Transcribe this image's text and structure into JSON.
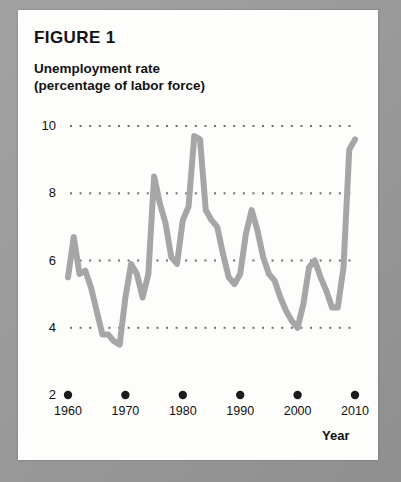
{
  "figure": {
    "title": "FIGURE 1",
    "subtitle_line1": "Unemployment rate",
    "subtitle_line2": "(percentage of labor force)"
  },
  "axis": {
    "x_name": "Year"
  },
  "chart_data": {
    "type": "line",
    "title": "Unemployment rate (percentage of labor force)",
    "xlabel": "Year",
    "ylabel": "",
    "xlim": [
      1960,
      2010
    ],
    "ylim": [
      2,
      10
    ],
    "ytick_labels": [
      "10",
      "8",
      "6",
      "4",
      "2"
    ],
    "yticks": [
      10,
      8,
      6,
      4,
      2
    ],
    "xtick_labels": [
      "1960",
      "1970",
      "1980",
      "1990",
      "2000",
      "2010"
    ],
    "xticks": [
      1960,
      1970,
      1980,
      1990,
      2000,
      2010
    ],
    "grid": "horizontal-dotted",
    "legend": "none",
    "line_color": "#a6a6a6",
    "x": [
      1960,
      1961,
      1962,
      1963,
      1964,
      1965,
      1966,
      1967,
      1968,
      1969,
      1970,
      1971,
      1972,
      1973,
      1974,
      1975,
      1976,
      1977,
      1978,
      1979,
      1980,
      1981,
      1982,
      1983,
      1984,
      1985,
      1986,
      1987,
      1988,
      1989,
      1990,
      1991,
      1992,
      1993,
      1994,
      1995,
      1996,
      1997,
      1998,
      1999,
      2000,
      2001,
      2002,
      2003,
      2004,
      2005,
      2006,
      2007,
      2008,
      2009,
      2010
    ],
    "values": [
      5.5,
      6.7,
      5.6,
      5.7,
      5.2,
      4.5,
      3.8,
      3.8,
      3.6,
      3.5,
      4.9,
      5.9,
      5.6,
      4.9,
      5.6,
      8.5,
      7.7,
      7.1,
      6.1,
      5.9,
      7.2,
      7.6,
      9.7,
      9.6,
      7.5,
      7.2,
      7.0,
      6.2,
      5.5,
      5.3,
      5.6,
      6.8,
      7.5,
      6.9,
      6.1,
      5.6,
      5.4,
      4.9,
      4.5,
      4.2,
      4.0,
      4.7,
      5.8,
      6.0,
      5.5,
      5.1,
      4.6,
      4.6,
      5.8,
      9.3,
      9.6
    ]
  }
}
